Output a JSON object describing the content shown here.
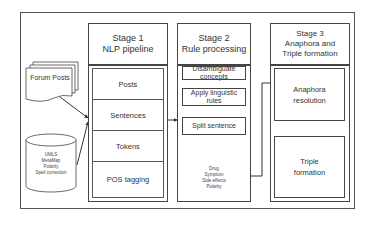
{
  "diagram": {
    "inputs": {
      "forum_posts": "Forum Posts",
      "resources_db": [
        "UMLS",
        "MetaMap",
        "Polarity",
        "Spell correction"
      ]
    },
    "stage1": {
      "title_line1": "Stage 1",
      "title_line2": "NLP pipeline",
      "steps": [
        "Posts",
        "Sentences",
        "Tokens",
        "POS tagging"
      ]
    },
    "stage2": {
      "title_line1": "Stage 2",
      "title_line2": "Rule processing",
      "steps": [
        "Disambiguate concepts",
        "Apply linguistic rules",
        "Split sentence"
      ],
      "output_db": [
        "Drug",
        "Symptom",
        "Side effects",
        "Polarity"
      ]
    },
    "stage3": {
      "title_line1": "Stage 3",
      "title_line2": "Anaphora and",
      "title_line3": "Triple formation",
      "steps": [
        "Anaphora resolution",
        "Triple formation"
      ]
    }
  }
}
